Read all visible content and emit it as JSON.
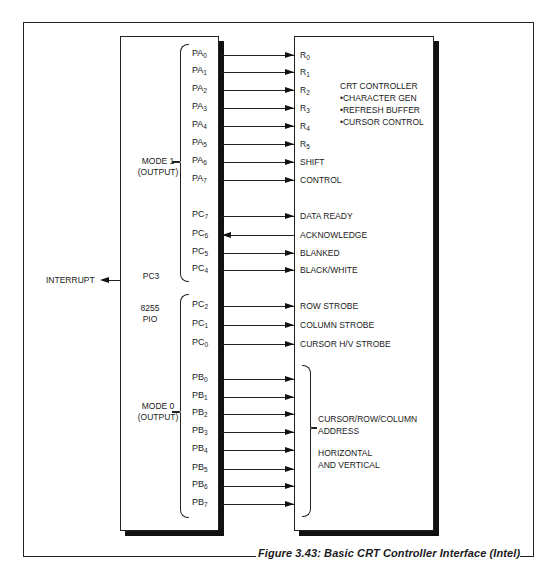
{
  "caption": "Figure 3.43: Basic CRT Controller Interface (Intel)",
  "pio": {
    "name_line1": "8255",
    "name_line2": "PIO",
    "interrupt_pin": "PC3",
    "interrupt_label": "INTERRUPT",
    "mode1_line1": "MODE 1",
    "mode1_line2": "(OUTPUT)",
    "mode0_line1": "MODE 0",
    "mode0_line2": "(OUTPUT)"
  },
  "crt": {
    "title": "CRT CONTROLLER",
    "features": [
      "•CHARACTER GEN",
      "•REFRESH BUFFER",
      "•CURSOR CONTROL"
    ],
    "bus_label_line1": "CURSOR/ROW/COLUMN",
    "bus_label_line2": "ADDRESS",
    "bus_label_line3": "HORIZONTAL",
    "bus_label_line4": "AND VERTICAL"
  },
  "connections": [
    {
      "pin": "PA",
      "sub": "0",
      "signal": "R",
      "signal_sub": "0",
      "direction": "to-crt"
    },
    {
      "pin": "PA",
      "sub": "1",
      "signal": "R",
      "signal_sub": "1",
      "direction": "to-crt"
    },
    {
      "pin": "PA",
      "sub": "2",
      "signal": "R",
      "signal_sub": "2",
      "direction": "to-crt"
    },
    {
      "pin": "PA",
      "sub": "3",
      "signal": "R",
      "signal_sub": "3",
      "direction": "to-crt"
    },
    {
      "pin": "PA",
      "sub": "4",
      "signal": "R",
      "signal_sub": "4",
      "direction": "to-crt"
    },
    {
      "pin": "PA",
      "sub": "5",
      "signal": "R",
      "signal_sub": "5",
      "direction": "to-crt"
    },
    {
      "pin": "PA",
      "sub": "6",
      "signal": "SHIFT",
      "signal_sub": "",
      "direction": "to-crt"
    },
    {
      "pin": "PA",
      "sub": "7",
      "signal": "CONTROL",
      "signal_sub": "",
      "direction": "to-crt"
    },
    {
      "pin": "PC",
      "sub": "7",
      "signal": "DATA READY",
      "signal_sub": "",
      "direction": "to-crt"
    },
    {
      "pin": "PC",
      "sub": "6",
      "signal": "ACKNOWLEDGE",
      "signal_sub": "",
      "direction": "to-pio"
    },
    {
      "pin": "PC",
      "sub": "5",
      "signal": "BLANKED",
      "signal_sub": "",
      "direction": "to-crt"
    },
    {
      "pin": "PC",
      "sub": "4",
      "signal": "BLACK/WHITE",
      "signal_sub": "",
      "direction": "to-crt"
    },
    {
      "pin": "PC",
      "sub": "2",
      "signal": "ROW STROBE",
      "signal_sub": "",
      "direction": "to-crt"
    },
    {
      "pin": "PC",
      "sub": "1",
      "signal": "COLUMN STROBE",
      "signal_sub": "",
      "direction": "to-crt"
    },
    {
      "pin": "PC",
      "sub": "0",
      "signal": "CURSOR H/V STROBE",
      "signal_sub": "",
      "direction": "to-crt"
    },
    {
      "pin": "PB",
      "sub": "0",
      "signal": "",
      "signal_sub": "",
      "direction": "to-crt"
    },
    {
      "pin": "PB",
      "sub": "1",
      "signal": "",
      "signal_sub": "",
      "direction": "to-crt"
    },
    {
      "pin": "PB",
      "sub": "2",
      "signal": "",
      "signal_sub": "",
      "direction": "to-crt"
    },
    {
      "pin": "PB",
      "sub": "3",
      "signal": "",
      "signal_sub": "",
      "direction": "to-crt"
    },
    {
      "pin": "PB",
      "sub": "4",
      "signal": "",
      "signal_sub": "",
      "direction": "to-crt"
    },
    {
      "pin": "PB",
      "sub": "5",
      "signal": "",
      "signal_sub": "",
      "direction": "to-crt"
    },
    {
      "pin": "PB",
      "sub": "6",
      "signal": "",
      "signal_sub": "",
      "direction": "to-crt"
    },
    {
      "pin": "PB",
      "sub": "7",
      "signal": "",
      "signal_sub": "",
      "direction": "to-crt"
    }
  ],
  "row_y": [
    55,
    72,
    90,
    108,
    126,
    144,
    162,
    180,
    216,
    235,
    253,
    270,
    306,
    325,
    344,
    379,
    397,
    414,
    432,
    450,
    469,
    486,
    504
  ]
}
